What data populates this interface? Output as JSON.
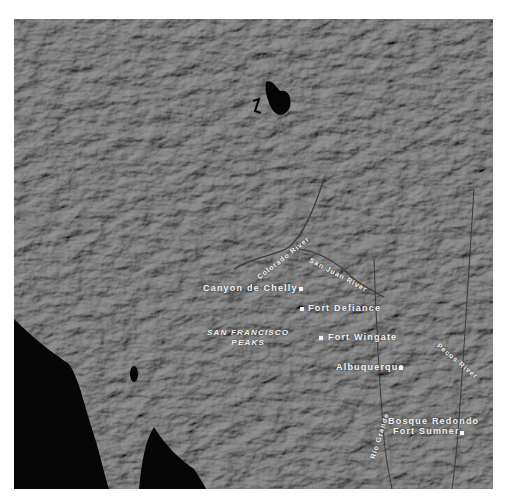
{
  "map": {
    "type": "shaded relief map",
    "region": "American Southwest",
    "places": [
      {
        "name": "Canyon de Chelly",
        "dot_side": "right"
      },
      {
        "name": "Fort Defiance",
        "dot_side": "left"
      },
      {
        "name": "Fort Wingate",
        "dot_side": "left"
      },
      {
        "name": "Albuquerque",
        "dot_side": "right"
      },
      {
        "name": "Bosque Redondo",
        "dot_side": "none"
      },
      {
        "name": "Fort Sumner",
        "dot_side": "right"
      }
    ],
    "peaks": {
      "line1": "SAN FRANCISCO",
      "line2": "PEAKS"
    },
    "rivers": [
      {
        "name": "Colorado River"
      },
      {
        "name": "San Juan River"
      },
      {
        "name": "Pecos River"
      },
      {
        "name": "Rio Grande"
      }
    ],
    "colors": {
      "land": "#6b6b6b",
      "water": "#050505",
      "label": "#f2f2f2",
      "background": "#ffffff"
    }
  }
}
